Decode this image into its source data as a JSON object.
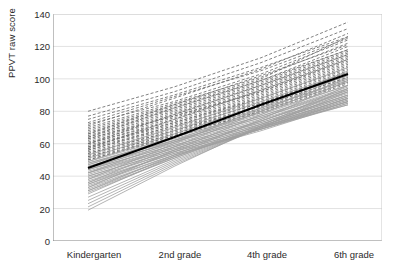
{
  "chart_data": {
    "type": "line",
    "title": "",
    "subtitle": "",
    "xlabel": "",
    "ylabel": "PPVT raw score",
    "categories": [
      "Kindergarten",
      "2nd grade",
      "4th grade",
      "6th grade"
    ],
    "x": [
      0,
      1,
      2,
      3
    ],
    "ylim": [
      0,
      140
    ],
    "yticks": [
      0,
      20,
      40,
      60,
      80,
      100,
      120,
      140
    ],
    "xticks": [
      "Kindergarten",
      "2nd grade",
      "4th grade",
      "6th grade"
    ],
    "grid": "horizontal",
    "legend": "none",
    "annotations": [],
    "colors": {
      "mean_line": "#000000",
      "dashed_lines": "#6b6b6b",
      "solid_lines": "#a0a0a0",
      "gridline": "#e2e2e2",
      "axis": "#808080",
      "text": "#2b2b2b",
      "background": "#ffffff"
    },
    "series": [
      {
        "name": "mean",
        "style": "solid-bold",
        "values": [
          45,
          64,
          84,
          103
        ]
      },
      {
        "name": "p01",
        "style": "dashed",
        "values": [
          80,
          95,
          113,
          135
        ]
      },
      {
        "name": "p02",
        "style": "dashed",
        "values": [
          77,
          92,
          110,
          131
        ]
      },
      {
        "name": "p03",
        "style": "dashed",
        "values": [
          75,
          90,
          107,
          126
        ]
      },
      {
        "name": "p04",
        "style": "dashed",
        "values": [
          73,
          89,
          105,
          125
        ]
      },
      {
        "name": "p05",
        "style": "dashed",
        "values": [
          72,
          86,
          103,
          124
        ]
      },
      {
        "name": "p06",
        "style": "dashed",
        "values": [
          70,
          85,
          101,
          122
        ]
      },
      {
        "name": "p07",
        "style": "dashed",
        "values": [
          69,
          84,
          100,
          126
        ]
      },
      {
        "name": "p08",
        "style": "dashed",
        "values": [
          68,
          83,
          99,
          120
        ]
      },
      {
        "name": "p09",
        "style": "dashed",
        "values": [
          67,
          82,
          98,
          118
        ]
      },
      {
        "name": "p10",
        "style": "dashed",
        "values": [
          66,
          81,
          97,
          117
        ]
      },
      {
        "name": "p11",
        "style": "dashed",
        "values": [
          65,
          80,
          96,
          116
        ]
      },
      {
        "name": "p12",
        "style": "dashed",
        "values": [
          64,
          79,
          95,
          115
        ]
      },
      {
        "name": "p13",
        "style": "dashed",
        "values": [
          63,
          78,
          94,
          114
        ]
      },
      {
        "name": "p14",
        "style": "dashed",
        "values": [
          63,
          77,
          93,
          113
        ]
      },
      {
        "name": "p15",
        "style": "dashed",
        "values": [
          62,
          77,
          92,
          112
        ]
      },
      {
        "name": "p16",
        "style": "dashed",
        "values": [
          61,
          76,
          92,
          111
        ]
      },
      {
        "name": "p17",
        "style": "dashed",
        "values": [
          60,
          75,
          91,
          110
        ]
      },
      {
        "name": "p18",
        "style": "dashed",
        "values": [
          60,
          74,
          90,
          109
        ]
      },
      {
        "name": "p19",
        "style": "dashed",
        "values": [
          59,
          73,
          89,
          108
        ]
      },
      {
        "name": "p20",
        "style": "dashed",
        "values": [
          58,
          73,
          88,
          107
        ]
      },
      {
        "name": "p21",
        "style": "dashed",
        "values": [
          58,
          72,
          88,
          106
        ]
      },
      {
        "name": "p22",
        "style": "dashed",
        "values": [
          57,
          71,
          87,
          105
        ]
      },
      {
        "name": "p23",
        "style": "dashed",
        "values": [
          56,
          71,
          86,
          104
        ]
      },
      {
        "name": "p24",
        "style": "dashed",
        "values": [
          56,
          70,
          85,
          104
        ]
      },
      {
        "name": "p25",
        "style": "dashed",
        "values": [
          55,
          69,
          85,
          103
        ]
      },
      {
        "name": "p26",
        "style": "dashed",
        "values": [
          54,
          68,
          84,
          102
        ]
      },
      {
        "name": "p27",
        "style": "dashed",
        "values": [
          54,
          68,
          83,
          101
        ]
      },
      {
        "name": "p28",
        "style": "dashed",
        "values": [
          53,
          67,
          83,
          101
        ]
      },
      {
        "name": "p29",
        "style": "dashed",
        "values": [
          52,
          66,
          82,
          100
        ]
      },
      {
        "name": "p30",
        "style": "dashed",
        "values": [
          52,
          66,
          81,
          99
        ]
      },
      {
        "name": "p31",
        "style": "dashed",
        "values": [
          51,
          65,
          80,
          98
        ]
      },
      {
        "name": "p32",
        "style": "dashed",
        "values": [
          50,
          65,
          80,
          98
        ]
      },
      {
        "name": "p33",
        "style": "dashed",
        "values": [
          50,
          64,
          79,
          97
        ]
      },
      {
        "name": "p34",
        "style": "solid",
        "values": [
          49,
          64,
          79,
          96
        ]
      },
      {
        "name": "p35",
        "style": "solid",
        "values": [
          48,
          63,
          78,
          96
        ]
      },
      {
        "name": "p36",
        "style": "solid",
        "values": [
          48,
          62,
          77,
          95
        ]
      },
      {
        "name": "p37",
        "style": "solid",
        "values": [
          47,
          62,
          77,
          94
        ]
      },
      {
        "name": "p38",
        "style": "solid",
        "values": [
          46,
          61,
          76,
          94
        ]
      },
      {
        "name": "p39",
        "style": "solid",
        "values": [
          46,
          61,
          76,
          93
        ]
      },
      {
        "name": "p40",
        "style": "solid",
        "values": [
          45,
          60,
          75,
          92
        ]
      },
      {
        "name": "p41",
        "style": "solid",
        "values": [
          44,
          59,
          74,
          92
        ]
      },
      {
        "name": "p42",
        "style": "solid",
        "values": [
          44,
          59,
          74,
          91
        ]
      },
      {
        "name": "p43",
        "style": "solid",
        "values": [
          43,
          58,
          73,
          90
        ]
      },
      {
        "name": "p44",
        "style": "solid",
        "values": [
          42,
          58,
          73,
          90
        ]
      },
      {
        "name": "p45",
        "style": "solid",
        "values": [
          42,
          57,
          72,
          89
        ]
      },
      {
        "name": "p46",
        "style": "solid",
        "values": [
          41,
          57,
          72,
          89
        ]
      },
      {
        "name": "p47",
        "style": "solid",
        "values": [
          40,
          56,
          71,
          88
        ]
      },
      {
        "name": "p48",
        "style": "solid",
        "values": [
          40,
          56,
          71,
          88
        ]
      },
      {
        "name": "p49",
        "style": "solid",
        "values": [
          39,
          55,
          70,
          87
        ]
      },
      {
        "name": "p50",
        "style": "solid",
        "values": [
          38,
          55,
          70,
          87
        ]
      },
      {
        "name": "p51",
        "style": "solid",
        "values": [
          37,
          54,
          69,
          86
        ]
      },
      {
        "name": "p52",
        "style": "solid",
        "values": [
          36,
          54,
          69,
          86
        ]
      },
      {
        "name": "p53",
        "style": "solid",
        "values": [
          35,
          53,
          68,
          85
        ]
      },
      {
        "name": "p54",
        "style": "solid",
        "values": [
          34,
          53,
          69,
          85
        ]
      },
      {
        "name": "p55",
        "style": "solid",
        "values": [
          33,
          52,
          69,
          84
        ]
      },
      {
        "name": "p56",
        "style": "solid",
        "values": [
          32,
          52,
          70,
          84
        ]
      },
      {
        "name": "p57",
        "style": "solid",
        "values": [
          31,
          51,
          70,
          86
        ]
      },
      {
        "name": "p58",
        "style": "solid",
        "values": [
          30,
          51,
          71,
          88
        ]
      },
      {
        "name": "p59",
        "style": "solid",
        "values": [
          29,
          52,
          72,
          90
        ]
      },
      {
        "name": "p60",
        "style": "solid",
        "values": [
          27,
          50,
          70,
          86
        ]
      },
      {
        "name": "p61",
        "style": "solid",
        "values": [
          25,
          49,
          70,
          88
        ]
      },
      {
        "name": "p62",
        "style": "solid",
        "values": [
          23,
          48,
          70,
          92
        ]
      },
      {
        "name": "p63",
        "style": "solid",
        "values": [
          21,
          47,
          70,
          94
        ]
      },
      {
        "name": "p64",
        "style": "solid",
        "values": [
          19,
          46,
          71,
          96
        ]
      },
      {
        "name": "p65",
        "style": "solid",
        "values": [
          31,
          53,
          75,
          99
        ]
      },
      {
        "name": "p66",
        "style": "solid",
        "values": [
          33,
          56,
          78,
          101
        ]
      },
      {
        "name": "p67",
        "style": "solid",
        "values": [
          36,
          58,
          80,
          103
        ]
      },
      {
        "name": "p68",
        "style": "solid",
        "values": [
          38,
          60,
          82,
          105
        ]
      },
      {
        "name": "p69",
        "style": "dashed",
        "values": [
          60,
          78,
          96,
          115
        ]
      },
      {
        "name": "p70",
        "style": "dashed",
        "values": [
          64,
          82,
          99,
          118
        ]
      },
      {
        "name": "p71",
        "style": "dashed",
        "values": [
          57,
          75,
          93,
          112
        ]
      },
      {
        "name": "p72",
        "style": "solid",
        "values": [
          49,
          66,
          84,
          102
        ]
      },
      {
        "name": "p73",
        "style": "solid",
        "values": [
          44,
          62,
          81,
          100
        ]
      },
      {
        "name": "p74",
        "style": "solid",
        "values": [
          47,
          64,
          82,
          99
        ]
      },
      {
        "name": "p75",
        "style": "solid",
        "values": [
          51,
          68,
          86,
          104
        ]
      },
      {
        "name": "p76",
        "style": "solid",
        "values": [
          42,
          61,
          80,
          98
        ]
      },
      {
        "name": "p77",
        "style": "dashed",
        "values": [
          66,
          84,
          102,
          121
        ]
      },
      {
        "name": "p78",
        "style": "dashed",
        "values": [
          71,
          88,
          106,
          128
        ]
      },
      {
        "name": "p79",
        "style": "solid",
        "values": [
          53,
          70,
          88,
          107
        ]
      },
      {
        "name": "p80",
        "style": "solid",
        "values": [
          35,
          55,
          74,
          93
        ]
      }
    ]
  }
}
